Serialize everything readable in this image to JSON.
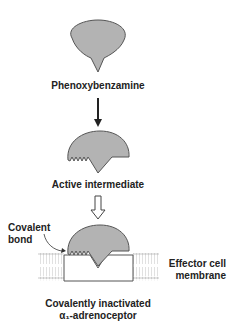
{
  "diagram": {
    "type": "mechanism",
    "stages": [
      {
        "label": "Phenoxybenzamine"
      },
      {
        "label": "Active intermediate"
      },
      {
        "label_line1": "Covalently inactivated",
        "label_line2": "α₁-adrenoceptor"
      }
    ],
    "annotations": {
      "covalent_bond_line1": "Covalent",
      "covalent_bond_line2": "bond",
      "membrane_line1": "Effector cell",
      "membrane_line2": "membrane"
    },
    "colors": {
      "drug_fill": "#b3b3b3",
      "outline": "#444444",
      "text": "#222222"
    }
  }
}
